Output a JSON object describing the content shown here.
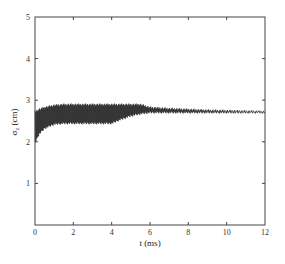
{
  "chart_data": {
    "type": "line",
    "title": "",
    "xlabel": "t (ms)",
    "ylabel": "σz (cm)",
    "xlim": [
      0,
      12
    ],
    "ylim": [
      0,
      5
    ],
    "xticks": [
      0,
      2,
      4,
      6,
      8,
      10,
      12
    ],
    "yticks": [
      1,
      2,
      3,
      4,
      5
    ],
    "grid": false,
    "legend": null,
    "series": [
      {
        "name": "sigma_z",
        "description": "rapidly oscillating signal; envelope upper/lower bounds",
        "x": [
          0,
          0.2,
          0.5,
          1.0,
          1.5,
          2.0,
          3.0,
          4.0,
          4.4,
          5.0,
          5.5,
          6.0,
          7.0,
          8.0,
          9.0,
          10.0,
          11.0,
          12.0
        ],
        "upper": [
          2.75,
          2.8,
          2.85,
          2.9,
          2.92,
          2.92,
          2.92,
          2.92,
          2.92,
          2.92,
          2.92,
          2.85,
          2.82,
          2.8,
          2.78,
          2.77,
          2.76,
          2.75
        ],
        "lower": [
          1.95,
          2.15,
          2.3,
          2.4,
          2.42,
          2.42,
          2.42,
          2.42,
          2.5,
          2.6,
          2.65,
          2.68,
          2.68,
          2.68,
          2.68,
          2.68,
          2.68,
          2.68
        ]
      }
    ]
  },
  "axes": {
    "x_tick_labels": [
      "0",
      "2",
      "4",
      "6",
      "8",
      "10",
      "12"
    ],
    "y_tick_labels": [
      "1",
      "2",
      "3",
      "4",
      "5"
    ],
    "xlabel": "t (ms)",
    "ylabel_main": "σ",
    "ylabel_sub": "z",
    "ylabel_unit": " (cm)"
  }
}
